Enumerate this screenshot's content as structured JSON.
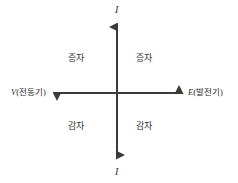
{
  "diagram": {
    "type": "quadrant-axes",
    "background_color": "#ffffff",
    "line_color": "#3a3a3a",
    "axes": {
      "vertical": {
        "name": "current-axis",
        "top_label": "I",
        "bottom_label": "I",
        "x": 117,
        "top_y": 22,
        "bottom_y": 160
      },
      "horizontal": {
        "name": "voltage-axis",
        "left_label_var": "V",
        "left_label_text": "(전동기)",
        "right_label_var": "E",
        "right_label_text": "(발전기)",
        "y": 93,
        "left_x": 52,
        "right_x": 184
      }
    },
    "quadrants": {
      "top_left": "증자",
      "top_right": "증자",
      "bottom_left": "감자",
      "bottom_right": "감자"
    }
  }
}
